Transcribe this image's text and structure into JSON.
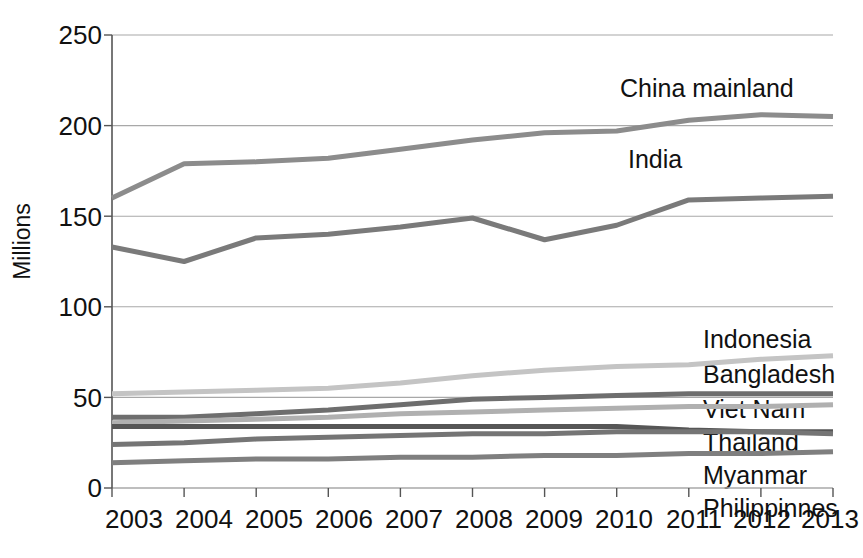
{
  "chart_data": {
    "type": "line",
    "title": "",
    "xlabel": "",
    "ylabel": "Millions",
    "x": [
      "2003",
      "2004",
      "2005",
      "2006",
      "2007",
      "2008",
      "2009",
      "2010",
      "2011",
      "2012",
      "2013"
    ],
    "categories": [
      "2003",
      "2004",
      "2005",
      "2006",
      "2007",
      "2008",
      "2009",
      "2010",
      "2011",
      "2012",
      "2013"
    ],
    "xlim": [
      2003,
      2013
    ],
    "ylim": [
      0,
      250
    ],
    "yticks": [
      0,
      50,
      100,
      150,
      200,
      250
    ],
    "ytick_labels": [
      "0",
      "50",
      "100",
      "150",
      "200",
      "250"
    ],
    "grid": "horizontal",
    "legend_position": "inline-right-of-lines",
    "series": [
      {
        "name": "China mainland",
        "color": "#8c8c8c",
        "values": [
          160,
          179,
          180,
          182,
          187,
          192,
          196,
          197,
          203,
          206,
          205
        ]
      },
      {
        "name": "India",
        "color": "#7a7a7a",
        "values": [
          133,
          125,
          138,
          140,
          144,
          149,
          137,
          145,
          159,
          160,
          161
        ]
      },
      {
        "name": "Indonesia",
        "color": "#c4c4c4",
        "values": [
          52,
          53,
          54,
          55,
          58,
          62,
          65,
          67,
          68,
          71,
          73
        ]
      },
      {
        "name": "Bangladesh",
        "color": "#6e6e6e",
        "values": [
          39,
          39,
          41,
          43,
          46,
          49,
          50,
          51,
          52,
          52,
          52
        ]
      },
      {
        "name": "Viet Nam",
        "color": "#b0b0b0",
        "values": [
          36,
          37,
          38,
          39,
          41,
          42,
          43,
          44,
          45,
          45,
          46
        ]
      },
      {
        "name": "Thailand",
        "color": "#565656",
        "values": [
          34,
          34,
          34,
          34,
          34,
          34,
          34,
          34,
          32,
          31,
          31
        ]
      },
      {
        "name": "Myanmar",
        "color": "#757575",
        "values": [
          24,
          25,
          27,
          28,
          29,
          30,
          30,
          31,
          31,
          31,
          30
        ]
      },
      {
        "name": "Philippinnes",
        "color": "#7f7f7f",
        "values": [
          14,
          15,
          16,
          16,
          17,
          17,
          18,
          18,
          19,
          19,
          20
        ]
      }
    ]
  },
  "axis": {
    "y_title": "Millions",
    "y_tick_labels": [
      "250",
      "200",
      "150",
      "100",
      "50",
      "0"
    ],
    "x_tick_labels": [
      "2003",
      "2004",
      "2005",
      "2006",
      "2007",
      "2008",
      "2009",
      "2010",
      "2011",
      "2012",
      "2013"
    ]
  },
  "series_labels": {
    "china": "China mainland",
    "india": "India",
    "indonesia": "Indonesia",
    "bangladesh": "Bangladesh",
    "vietnam": "Viet Nam",
    "thailand": "Thailand",
    "myanmar": "Myanmar",
    "philippines": "Philippinnes"
  },
  "colors": {
    "axis": "#555555",
    "grid": "#a8a8a8",
    "text": "#111111",
    "background": "#ffffff"
  }
}
